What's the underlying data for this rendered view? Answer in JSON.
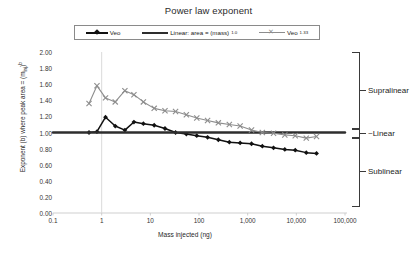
{
  "chart_data": {
    "type": "line",
    "title": "Power law exponent",
    "xlabel": "Mass injected (ng)",
    "ylabel": "Exponent (b) where peak area = (m_inj)^b",
    "ylabel_parts": {
      "main": "Exponent (b) where peak area = (m",
      "sub": "inj",
      "tail": ")",
      "sup": "b"
    },
    "xscale": "log",
    "xlim": [
      0.1,
      100000
    ],
    "ylim": [
      0.0,
      2.0
    ],
    "xticks": [
      "0.1",
      "1",
      "10",
      "100",
      "1,000",
      "10,000",
      "100,000"
    ],
    "xtick_values": [
      0.1,
      1,
      10,
      100,
      1000,
      10000,
      100000
    ],
    "yticks": [
      "0.00",
      "0.20",
      "0.40",
      "0.60",
      "0.80",
      "1.00",
      "1.20",
      "1.40",
      "1.60",
      "1.80",
      "2.00"
    ],
    "ytick_values": [
      0.0,
      0.2,
      0.4,
      0.6,
      0.8,
      1.0,
      1.2,
      1.4,
      1.6,
      1.8,
      2.0
    ],
    "grid": false,
    "legend_position": "top",
    "series": [
      {
        "name": "Veo",
        "color": "#111111",
        "marker": "diamond",
        "x": [
          0.55,
          0.8,
          1.2,
          1.9,
          3.0,
          4.6,
          7.2,
          12,
          20,
          33,
          55,
          90,
          150,
          250,
          420,
          700,
          1200,
          2000,
          3400,
          5800,
          9500,
          16000,
          26000
        ],
        "y": [
          1.0,
          1.01,
          1.19,
          1.08,
          1.03,
          1.13,
          1.11,
          1.09,
          1.05,
          1.0,
          0.98,
          0.96,
          0.94,
          0.91,
          0.88,
          0.87,
          0.86,
          0.83,
          0.81,
          0.79,
          0.78,
          0.75,
          0.74
        ]
      },
      {
        "name": "Linear: area = (mass)^1.0",
        "color": "#2e2e2e",
        "marker": "none",
        "x": [
          0.1,
          100000
        ],
        "y": [
          1.0,
          1.0
        ]
      },
      {
        "name": "Veo^1.33",
        "color": "#8d8d8d",
        "marker": "x",
        "x": [
          0.55,
          0.8,
          1.2,
          1.9,
          3.0,
          4.6,
          7.2,
          12,
          20,
          33,
          55,
          90,
          150,
          250,
          420,
          700,
          1200,
          2000,
          3400,
          5800,
          9500,
          16000,
          26000
        ],
        "y": [
          1.36,
          1.58,
          1.43,
          1.38,
          1.52,
          1.47,
          1.38,
          1.3,
          1.27,
          1.26,
          1.22,
          1.18,
          1.15,
          1.12,
          1.1,
          1.08,
          1.03,
          1.0,
          0.99,
          0.97,
          0.96,
          0.93,
          0.95
        ]
      }
    ],
    "annotations": [
      {
        "label": "Supralinear",
        "y_range": [
          1.06,
          2.0
        ]
      },
      {
        "label": "~Linear",
        "y_range": [
          0.94,
          1.06
        ]
      },
      {
        "label": "Sublinear",
        "y_range": [
          0.1,
          0.94
        ]
      }
    ]
  },
  "legend": {
    "items": [
      {
        "label": "Veo",
        "sup": "",
        "marker": "diamond-line"
      },
      {
        "label": "Linear: area = (mass)",
        "sup": "1.0",
        "marker": "thick-line"
      },
      {
        "label": "Veo",
        "sup": "1.33",
        "marker": "x-line"
      }
    ]
  }
}
